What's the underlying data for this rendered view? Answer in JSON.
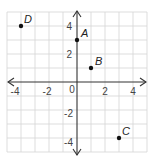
{
  "figure": {
    "type": "coordinate-plane",
    "x_range": [
      -5,
      5
    ],
    "y_range": [
      -5,
      5
    ],
    "grid_step": 1,
    "x_tick_labels": [
      "-4",
      "-2",
      "0",
      "2",
      "4"
    ],
    "y_tick_labels": [
      "4",
      "2",
      "-2",
      "-4"
    ],
    "origin_label": "0",
    "points": [
      {
        "label": "A",
        "x": 0,
        "y": 3
      },
      {
        "label": "B",
        "x": 1,
        "y": 1
      },
      {
        "label": "C",
        "x": 3,
        "y": -4
      },
      {
        "label": "D",
        "x": -4,
        "y": 4
      }
    ],
    "colors": {
      "grid": "#d4d4d4",
      "axis": "#333333",
      "point": "#111111"
    }
  }
}
